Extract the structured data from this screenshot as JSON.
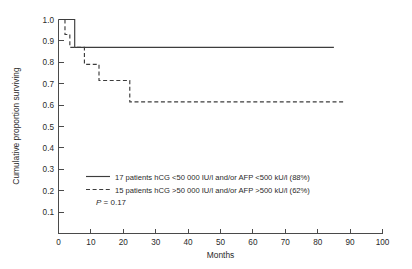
{
  "chart_data": {
    "type": "line",
    "title": "",
    "xlabel": "Months",
    "ylabel": "Cumulative proportion surviving",
    "xlim": [
      0,
      100
    ],
    "ylim": [
      0,
      1.0
    ],
    "grid": false,
    "xticks": [
      0,
      10,
      20,
      30,
      40,
      50,
      60,
      70,
      80,
      90,
      100
    ],
    "xtick_labels": [
      "0",
      "10",
      "20",
      "30",
      "40",
      "50",
      "60",
      "70",
      "80",
      "90",
      "100"
    ],
    "yticks": [
      0.1,
      0.2,
      0.3,
      0.4,
      0.5,
      0.6,
      0.7,
      0.8,
      0.9,
      1.0
    ],
    "ytick_labels": [
      "0.1",
      "0.2",
      "0.3",
      "0.4",
      "0.5",
      "0.6",
      "0.7",
      "0.8",
      "0.9",
      "1.0"
    ],
    "legend_position": "center",
    "annotations": [
      {
        "name": "p-value",
        "text": "P = 0.17",
        "italic_prefix": "P",
        "rest": " = 0.17"
      }
    ],
    "series": [
      {
        "name": "low-marker-group",
        "style": "solid",
        "label": "17 patients hCG <50 000 IU/l and/or AFP <500 kU/l (88%)",
        "n_patients": 17,
        "survival_percent": 88,
        "steps": [
          {
            "x": 0.0,
            "y": 1.0
          },
          {
            "x": 5.0,
            "y": 1.0
          },
          {
            "x": 5.0,
            "y": 0.87
          },
          {
            "x": 85.0,
            "y": 0.87
          }
        ]
      },
      {
        "name": "high-marker-group",
        "style": "dashed",
        "label": "15 patients hCG >50 000 IU/l and/or AFP >500 kU/l (62%)",
        "n_patients": 15,
        "survival_percent": 62,
        "steps": [
          {
            "x": 0.0,
            "y": 1.0
          },
          {
            "x": 2.0,
            "y": 1.0
          },
          {
            "x": 2.0,
            "y": 0.93
          },
          {
            "x": 3.5,
            "y": 0.93
          },
          {
            "x": 3.5,
            "y": 0.87
          },
          {
            "x": 8.0,
            "y": 0.87
          },
          {
            "x": 8.0,
            "y": 0.79
          },
          {
            "x": 12.5,
            "y": 0.79
          },
          {
            "x": 12.5,
            "y": 0.715
          },
          {
            "x": 22.0,
            "y": 0.715
          },
          {
            "x": 22.0,
            "y": 0.615
          },
          {
            "x": 88.0,
            "y": 0.615
          }
        ]
      }
    ]
  },
  "legend": {
    "entries": [
      {
        "swatch": "solid-line",
        "label": "17 patients hCG <50 000 IU/l and/or AFP <500 kU/l (88%)"
      },
      {
        "swatch": "dashed-line",
        "label": "15 patients hCG >50 000 IU/l and/or AFP >500 kU/l (62%)"
      }
    ],
    "pvalue_prefix": "P",
    "pvalue_rest": " = 0.17"
  },
  "colors": {
    "background": "#ffffff",
    "curve": "#3d3d3d",
    "axis": "#4a4a4a",
    "text": "#2a2a2a"
  }
}
